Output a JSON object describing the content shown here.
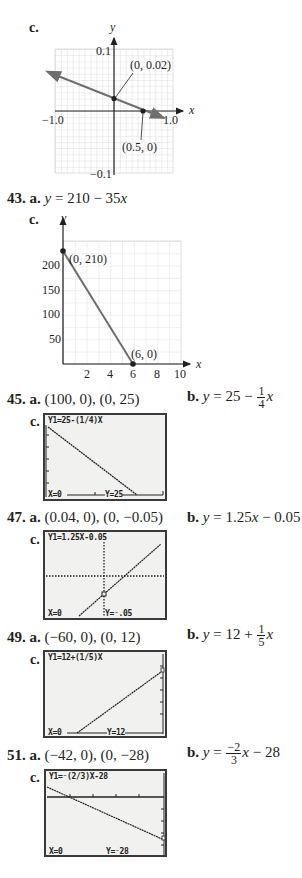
{
  "item_41c": {
    "part_label": "c.",
    "y_axis_label": "y",
    "x_axis_label": "x",
    "y_max_label": "0.1",
    "y_min_label": "−0.1",
    "x_min_label": "−1.0",
    "x_max_label": "1.0",
    "point1_label": "(0, 0.02)",
    "point2_label": "(0.5, 0)"
  },
  "item_43": {
    "number": "43.",
    "part_a": "a.",
    "equation_a_prefix": "y",
    "equation_a_rest": " = 210 − 35",
    "equation_a_var": "x",
    "part_c": "c.",
    "y_axis_label": "y",
    "x_axis_label": "x",
    "y_ticks": [
      "200",
      "150",
      "100",
      "50"
    ],
    "x_ticks": [
      "2",
      "4",
      "6",
      "8",
      "10"
    ],
    "point1_label": "(0, 210)",
    "point2_label": "(6, 0)"
  },
  "item_45": {
    "number": "45.",
    "part_a": "a.",
    "answer_a": "(100, 0), (0, 25)",
    "part_b": "b.",
    "answer_b_lhs": "y",
    "answer_b_mid": " = 25 − ",
    "frac_num": "1",
    "frac_den": "4",
    "answer_b_var": "x",
    "part_c": "c.",
    "screen_eq": "Y1=25-(1/4)X",
    "screen_x": "X=0",
    "screen_y": "Y=25"
  },
  "item_47": {
    "number": "47.",
    "part_a": "a.",
    "answer_a": "(0.04, 0), (0, −0.05)",
    "part_b": "b.",
    "answer_b_lhs": "y",
    "answer_b_mid": " = 1.25",
    "answer_b_var": "x",
    "answer_b_tail": " − 0.05",
    "part_c": "c.",
    "screen_eq": "Y1=1.25X-0.05",
    "screen_x": "X=0",
    "screen_y": "Y=⁻.05"
  },
  "item_49": {
    "number": "49.",
    "part_a": "a.",
    "answer_a": "(−60, 0), (0, 12)",
    "part_b": "b.",
    "answer_b_lhs": "y",
    "answer_b_mid": " = 12 + ",
    "frac_num": "1",
    "frac_den": "5",
    "answer_b_var": "x",
    "part_c": "c.",
    "screen_eq": "Y1=12+(1/5)X",
    "screen_x": "X=0",
    "screen_y": "Y=12"
  },
  "item_51": {
    "number": "51.",
    "part_a": "a.",
    "answer_a": "(−42, 0), (0, −28)",
    "part_b": "b.",
    "answer_b_lhs": "y",
    "answer_b_mid": " = ",
    "frac_num": "−2",
    "frac_den": "3",
    "answer_b_var": "x",
    "answer_b_tail": " − 28",
    "part_c": "c.",
    "screen_eq": "Y1=⁻(2/3)X-28",
    "screen_x": "X=0",
    "screen_y": "Y=⁻28"
  }
}
